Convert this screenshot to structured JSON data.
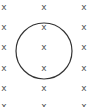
{
  "diagram": {
    "field_symbol": "x",
    "grid": {
      "columns_x": [
        4,
        44,
        84
      ],
      "rows_y": [
        10,
        30,
        50,
        71,
        91,
        109
      ]
    },
    "circle": {
      "cx": 44,
      "cy": 51,
      "r": 28,
      "stroke": "#333333"
    }
  }
}
